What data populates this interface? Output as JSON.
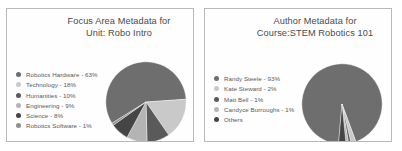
{
  "chart_data": [
    {
      "type": "pie",
      "title": "Focus Area Metadata for\nUnit: Robo Intro",
      "categories": [
        "Robotics Hardware",
        "Technology",
        "Humanities",
        "Engineering",
        "Science",
        "Robotics Software"
      ],
      "values": [
        63,
        18,
        10,
        9,
        8,
        1
      ],
      "value_unit": "%",
      "legend_entries": [
        "Robotics Hardware - 63%",
        "Technology - 18%",
        "Humanities - 10%",
        "Engineering - 9%",
        "Science - 8%",
        "Robotics Software - 1%"
      ],
      "colors": [
        "#6e6e6e",
        "#c9c9c9",
        "#5a5a5a",
        "#b4b4b4",
        "#454545",
        "#8f8f8f"
      ],
      "legend_position": "left",
      "grid": false
    },
    {
      "type": "pie",
      "title": "Author Metadata for\nCourse:STEM Robotics 101",
      "categories": [
        "Randy Steele",
        "Kate Steward",
        "Matt Bell",
        "Candyce Burroughs",
        "Others"
      ],
      "values": [
        93,
        2,
        1,
        1,
        3
      ],
      "value_unit": "%",
      "legend_entries": [
        "Randy Steele - 93%",
        "Kate Steward - 2%",
        "Matt Bell - 1%",
        "Candyce Burroughs - 1%",
        "Others"
      ],
      "colors": [
        "#6e6e6e",
        "#c9c9c9",
        "#5a5a5a",
        "#b4b4b4",
        "#454545"
      ],
      "legend_position": "left",
      "grid": false
    }
  ],
  "panels": [
    {
      "id": "focus-area-metadata",
      "title": "Focus Area Metadata for\nUnit: Robo Intro"
    },
    {
      "id": "author-metadata",
      "title": "Author Metadata for\nCourse:STEM Robotics 101"
    }
  ]
}
